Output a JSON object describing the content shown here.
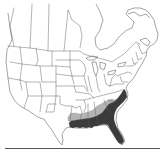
{
  "map": {
    "type": "species-range-map",
    "region": "North America (United States and southern Canada)",
    "style": "grayscale outline map with state/province borders",
    "legend_colors": {
      "primary_range": "#3b3b3b",
      "peripheral_range": "#b4b4b4",
      "background": "#ffffff",
      "borders": "#5a5a5a"
    },
    "shaded_regions": [
      {
        "name": "primary range",
        "shade": "dark",
        "areas": [
          "southeastern coastal plain",
          "Florida",
          "Georgia (south/coast)",
          "South Carolina (coast)",
          "North Carolina (coast)",
          "Alabama (south)",
          "Mississippi (south)",
          "Louisiana",
          "east Texas (edge)"
        ]
      },
      {
        "name": "peripheral range",
        "shade": "light",
        "areas": [
          "Arkansas (south)",
          "north Louisiana",
          "central Mississippi",
          "central Alabama",
          "Georgia piedmont",
          "South Carolina piedmont"
        ]
      }
    ]
  },
  "footer": {
    "rule_visible": true
  }
}
